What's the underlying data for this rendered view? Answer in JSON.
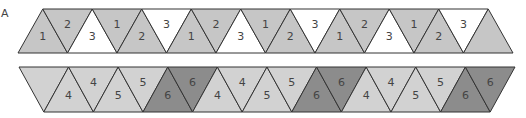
{
  "panel_label": "A",
  "colors": {
    "medium_gray": "#c6c6c6",
    "white": "#ffffff",
    "light_gray": "#d2d2d2",
    "dark_gray": "#8c8c8c",
    "stroke": "#333333"
  },
  "top_strip": {
    "y_top": 9,
    "y_bottom": 53,
    "x_start_bottom": 18,
    "step": 49.5,
    "first_orientation": "up",
    "triangles": [
      {
        "label": "1",
        "fill": "medium_gray"
      },
      {
        "label": "2",
        "fill": "medium_gray"
      },
      {
        "label": "3",
        "fill": "white"
      },
      {
        "label": "1",
        "fill": "medium_gray"
      },
      {
        "label": "2",
        "fill": "medium_gray"
      },
      {
        "label": "3",
        "fill": "white"
      },
      {
        "label": "1",
        "fill": "medium_gray"
      },
      {
        "label": "2",
        "fill": "medium_gray"
      },
      {
        "label": "3",
        "fill": "white"
      },
      {
        "label": "1",
        "fill": "medium_gray"
      },
      {
        "label": "2",
        "fill": "medium_gray"
      },
      {
        "label": "3",
        "fill": "white"
      },
      {
        "label": "1",
        "fill": "medium_gray"
      },
      {
        "label": "2",
        "fill": "medium_gray"
      },
      {
        "label": "3",
        "fill": "white"
      },
      {
        "label": "1",
        "fill": "medium_gray"
      },
      {
        "label": "2",
        "fill": "medium_gray"
      },
      {
        "label": "3",
        "fill": "white"
      },
      {
        "label": "",
        "fill": "medium_gray"
      }
    ]
  },
  "bottom_strip": {
    "y_top": 67,
    "y_bottom": 112,
    "x_start_top": 19,
    "step": 49.6,
    "first_orientation": "down",
    "triangles": [
      {
        "label": "",
        "fill": "light_gray"
      },
      {
        "label": "4",
        "fill": "light_gray"
      },
      {
        "label": "4",
        "fill": "light_gray"
      },
      {
        "label": "5",
        "fill": "light_gray"
      },
      {
        "label": "5",
        "fill": "light_gray"
      },
      {
        "label": "6",
        "fill": "dark_gray"
      },
      {
        "label": "6",
        "fill": "dark_gray"
      },
      {
        "label": "4",
        "fill": "light_gray"
      },
      {
        "label": "4",
        "fill": "light_gray"
      },
      {
        "label": "5",
        "fill": "light_gray"
      },
      {
        "label": "5",
        "fill": "light_gray"
      },
      {
        "label": "6",
        "fill": "dark_gray"
      },
      {
        "label": "6",
        "fill": "dark_gray"
      },
      {
        "label": "4",
        "fill": "light_gray"
      },
      {
        "label": "4",
        "fill": "light_gray"
      },
      {
        "label": "5",
        "fill": "light_gray"
      },
      {
        "label": "5",
        "fill": "light_gray"
      },
      {
        "label": "6",
        "fill": "dark_gray"
      },
      {
        "label": "6",
        "fill": "dark_gray"
      }
    ]
  }
}
